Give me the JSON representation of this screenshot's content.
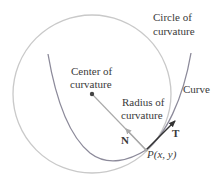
{
  "diagram": {
    "labels": {
      "circle_line1": "Circle of",
      "circle_line2": "curvature",
      "center_line1": "Center of",
      "center_line2": "curvature",
      "radius_line1": "Radius of",
      "radius_line2": "curvature",
      "curve": "Curve",
      "normal": "N",
      "tangent": "T",
      "point_P": "P",
      "point_args": "(x, y)"
    },
    "colors": {
      "circle": "#c9c9c9",
      "curve": "#8c8a9a",
      "radius": "#a9a9a9",
      "tangent": "#333333",
      "center_dot": "#444444",
      "text": "#3a3a3a"
    },
    "geometry": {
      "circle_center": [
        92,
        94
      ],
      "circle_radius": 79,
      "point_P": [
        146,
        150
      ],
      "tangent_tip": [
        176,
        120
      ],
      "normal_tip": [
        125,
        128
      ]
    }
  }
}
